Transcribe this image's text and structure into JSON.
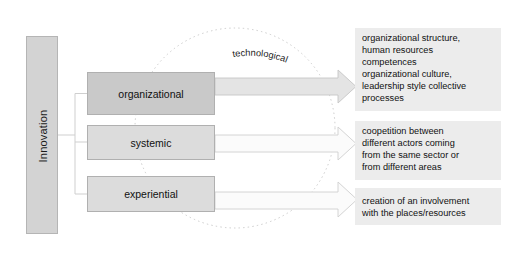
{
  "diagram": {
    "title_note": "",
    "root": {
      "label": "Innovation"
    },
    "circle_label": "technological",
    "categories": [
      {
        "label": "organizational",
        "fill": "#c9c9c9"
      },
      {
        "label": "systemic",
        "fill": "#dcdcdc"
      },
      {
        "label": "experiential",
        "fill": "#dcdcdc"
      }
    ],
    "descriptions": [
      {
        "lines": [
          "organizational structure,",
          "human resources",
          "competences",
          "organizational culture,",
          "leadership style collective",
          "processes"
        ]
      },
      {
        "lines": [
          "coopetition between",
          "different actors coming",
          "from the same sector or",
          "from different areas"
        ]
      },
      {
        "lines": [
          "creation of an involvement",
          " with the places/resources"
        ]
      }
    ],
    "colors": {
      "root_fill": "#d3d3d3",
      "box_fill_dark": "#c9c9c9",
      "box_fill_light": "#dcdcdc",
      "text_block_fill": "#ececec",
      "arrow_fill_dark": "#e2e2e2",
      "arrow_fill_light": "#fafafa",
      "outline": "#b0b0b0",
      "dotted_circle": "#cccccc"
    }
  }
}
